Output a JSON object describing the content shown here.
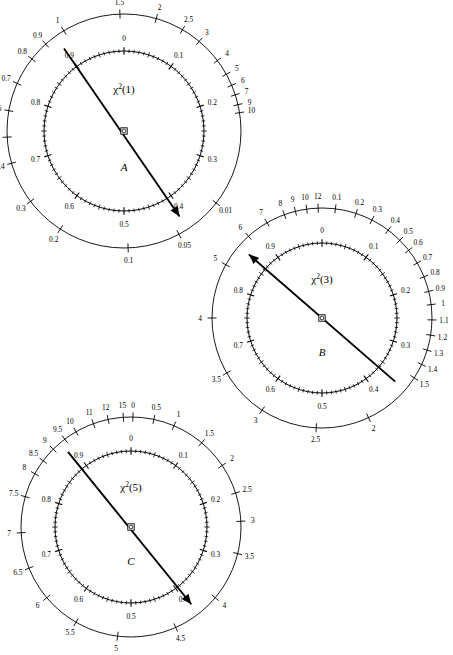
{
  "page": {
    "running_head": "",
    "background": "#ffffff",
    "ink": "#000000",
    "width": 439,
    "height": 644
  },
  "chart_data": {
    "type": "other",
    "chart_kind": "circular-nomogram-dials",
    "dials": [
      {
        "panel": "A",
        "title": "χ²(1)",
        "title_base": "χ",
        "title_sup": "2",
        "title_arg": "(1)",
        "center": [
          124,
          131
        ],
        "outer_radius": 117,
        "inner_radius": 80,
        "needle_deg_from": 234,
        "needle_deg_to": 57,
        "needle_head": "to",
        "outer_scale": {
          "name": "chi-square-scale",
          "labels": [
            {
              "text": "0.01",
              "deg": 38
            },
            {
              "text": "0.05",
              "deg": 62
            },
            {
              "text": "0.1",
              "deg": 88
            },
            {
              "text": "0.2",
              "deg": 123
            },
            {
              "text": "0.3",
              "deg": 143
            },
            {
              "text": "0.4",
              "deg": 164
            },
            {
              "text": "0.5",
              "deg": 177
            },
            {
              "text": "0.6",
              "deg": 190
            },
            {
              "text": "0.7",
              "deg": 204
            },
            {
              "text": "0.8",
              "deg": 218
            },
            {
              "text": "0.9",
              "deg": 228
            },
            {
              "text": "1",
              "deg": 239
            },
            {
              "text": "1.5",
              "deg": 268
            },
            {
              "text": "2",
              "deg": 286
            },
            {
              "text": "2.5",
              "deg": 300
            },
            {
              "text": "3",
              "deg": 310
            },
            {
              "text": "4",
              "deg": 323
            },
            {
              "text": "5",
              "deg": 331
            },
            {
              "text": "6",
              "deg": 337
            },
            {
              "text": "7",
              "deg": 342
            },
            {
              "text": "9",
              "deg": 347
            },
            {
              "text": "10",
              "deg": 351
            }
          ]
        },
        "inner_scale": {
          "name": "probability-scale",
          "labels": [
            {
              "text": "0",
              "deg": 270
            },
            {
              "text": "0.1",
              "deg": 306
            },
            {
              "text": "0.2",
              "deg": 342
            },
            {
              "text": "0.3",
              "deg": 18
            },
            {
              "text": "0.4",
              "deg": 54
            },
            {
              "text": "0.5",
              "deg": 90
            },
            {
              "text": "0.6",
              "deg": 126
            },
            {
              "text": "0.7",
              "deg": 162
            },
            {
              "text": "0.8",
              "deg": 198
            },
            {
              "text": "0.9",
              "deg": 234
            }
          ]
        }
      },
      {
        "panel": "B",
        "title": "χ²(3)",
        "title_base": "χ",
        "title_sup": "2",
        "title_arg": "(3)",
        "center": [
          322,
          318
        ],
        "outer_radius": 110,
        "inner_radius": 75,
        "needle_deg_from": 221,
        "needle_deg_to": 41,
        "needle_head": "from",
        "outer_scale": {
          "name": "chi-square-scale",
          "labels": [
            {
              "text": "0.1",
              "deg": 277
            },
            {
              "text": "0.2",
              "deg": 288
            },
            {
              "text": "0.3",
              "deg": 297
            },
            {
              "text": "0.4",
              "deg": 307
            },
            {
              "text": "0.5",
              "deg": 315
            },
            {
              "text": "0.6",
              "deg": 322
            },
            {
              "text": "0.7",
              "deg": 330
            },
            {
              "text": "0.8",
              "deg": 338
            },
            {
              "text": "0.9",
              "deg": 346
            },
            {
              "text": "1",
              "deg": 353
            },
            {
              "text": "1.1",
              "deg": 1
            },
            {
              "text": "1.2",
              "deg": 9
            },
            {
              "text": "1.3",
              "deg": 17
            },
            {
              "text": "1.4",
              "deg": 25
            },
            {
              "text": "1.5",
              "deg": 33
            },
            {
              "text": "2",
              "deg": 65
            },
            {
              "text": "2.5",
              "deg": 93
            },
            {
              "text": "3",
              "deg": 123
            },
            {
              "text": "3.5",
              "deg": 150
            },
            {
              "text": "4",
              "deg": 180
            },
            {
              "text": "5",
              "deg": 209
            },
            {
              "text": "6",
              "deg": 228
            },
            {
              "text": "7",
              "deg": 240
            },
            {
              "text": "8",
              "deg": 250
            },
            {
              "text": "9",
              "deg": 256
            },
            {
              "text": "10",
              "deg": 262
            },
            {
              "text": "12",
              "deg": 268
            }
          ]
        },
        "inner_scale": {
          "name": "probability-scale",
          "labels": [
            {
              "text": "0",
              "deg": 270
            },
            {
              "text": "0.1",
              "deg": 306
            },
            {
              "text": "0.2",
              "deg": 342
            },
            {
              "text": "0.3",
              "deg": 18
            },
            {
              "text": "0.4",
              "deg": 54
            },
            {
              "text": "0.5",
              "deg": 90
            },
            {
              "text": "0.6",
              "deg": 126
            },
            {
              "text": "0.7",
              "deg": 162
            },
            {
              "text": "0.8",
              "deg": 198
            },
            {
              "text": "0.9",
              "deg": 234
            }
          ]
        }
      },
      {
        "panel": "C",
        "title": "χ²(5)",
        "title_base": "χ",
        "title_sup": "2",
        "title_arg": "(5)",
        "center": [
          131,
          527
        ],
        "outer_radius": 110,
        "inner_radius": 76,
        "needle_deg_from": 230,
        "needle_deg_to": 52,
        "needle_head": "to",
        "outer_scale": {
          "name": "chi-square-scale",
          "labels": [
            {
              "text": "0",
              "deg": 271
            },
            {
              "text": "0.5",
              "deg": 282
            },
            {
              "text": "1",
              "deg": 293
            },
            {
              "text": "1.5",
              "deg": 310
            },
            {
              "text": "2",
              "deg": 326
            },
            {
              "text": "2.5",
              "deg": 342
            },
            {
              "text": "3",
              "deg": 357
            },
            {
              "text": "3.5",
              "deg": 14
            },
            {
              "text": "4",
              "deg": 40
            },
            {
              "text": "4.5",
              "deg": 66
            },
            {
              "text": "5",
              "deg": 97
            },
            {
              "text": "5.5",
              "deg": 120
            },
            {
              "text": "6",
              "deg": 140
            },
            {
              "text": "6.5",
              "deg": 158
            },
            {
              "text": "7",
              "deg": 177
            },
            {
              "text": "7.5",
              "deg": 196
            },
            {
              "text": "8",
              "deg": 209
            },
            {
              "text": "8.5",
              "deg": 217
            },
            {
              "text": "9",
              "deg": 225
            },
            {
              "text": "9.5",
              "deg": 233
            },
            {
              "text": "10",
              "deg": 240
            },
            {
              "text": "11",
              "deg": 250
            },
            {
              "text": "12",
              "deg": 258
            },
            {
              "text": "15",
              "deg": 266
            }
          ]
        },
        "inner_scale": {
          "name": "probability-scale",
          "labels": [
            {
              "text": "0",
              "deg": 270
            },
            {
              "text": "0.1",
              "deg": 306
            },
            {
              "text": "0.2",
              "deg": 342
            },
            {
              "text": "0.3",
              "deg": 18
            },
            {
              "text": "0.4",
              "deg": 54
            },
            {
              "text": "0.5",
              "deg": 90
            },
            {
              "text": "0.6",
              "deg": 126
            },
            {
              "text": "0.7",
              "deg": 162
            },
            {
              "text": "0.8",
              "deg": 198
            },
            {
              "text": "0.9",
              "deg": 234
            }
          ]
        }
      }
    ]
  }
}
